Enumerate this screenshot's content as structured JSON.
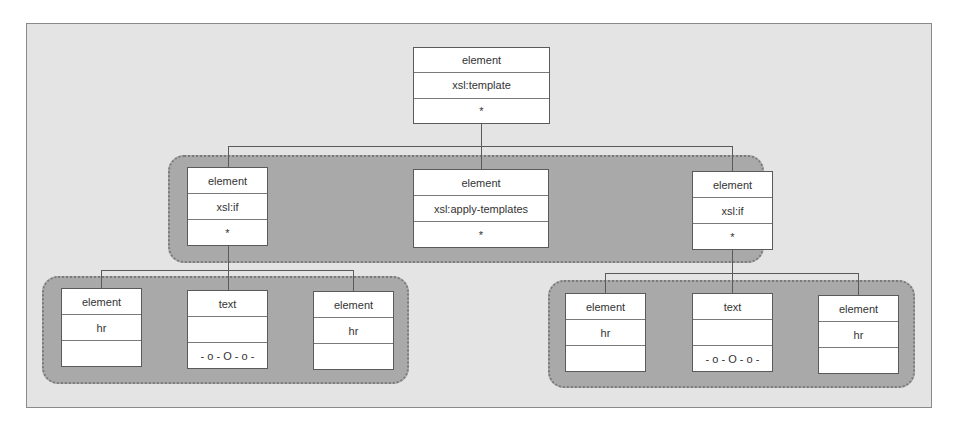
{
  "diagram": {
    "type": "tree",
    "root": {
      "id": "root",
      "kind": "element",
      "name": "xsl:template",
      "value": "*",
      "box": {
        "x": 413,
        "y": 47,
        "w": 137,
        "h": 77
      }
    },
    "level2": {
      "group_box": {
        "x": 168,
        "y": 155,
        "w": 596,
        "h": 108
      },
      "nodes": [
        {
          "id": "if-left",
          "kind": "element",
          "name": "xsl:if",
          "value": "*",
          "box": {
            "x": 187,
            "y": 167,
            "w": 81,
            "h": 79
          }
        },
        {
          "id": "apply",
          "kind": "element",
          "name": "xsl:apply-templates",
          "value": "*",
          "box": {
            "x": 413,
            "y": 169,
            "w": 136,
            "h": 79
          }
        },
        {
          "id": "if-right",
          "kind": "element",
          "name": "xsl:if",
          "value": "*",
          "box": {
            "x": 692,
            "y": 171,
            "w": 81,
            "h": 79
          }
        }
      ]
    },
    "level3_left": {
      "parent": "if-left",
      "group_box": {
        "x": 42,
        "y": 276,
        "w": 367,
        "h": 108
      },
      "nodes": [
        {
          "kind": "element",
          "name": "hr",
          "value": "",
          "box": {
            "x": 61,
            "y": 288,
            "w": 81,
            "h": 79
          }
        },
        {
          "kind": "text",
          "name": "",
          "value": "- o - O - o -",
          "box": {
            "x": 187,
            "y": 290,
            "w": 81,
            "h": 79
          }
        },
        {
          "kind": "element",
          "name": "hr",
          "value": "",
          "box": {
            "x": 313,
            "y": 291,
            "w": 81,
            "h": 79
          }
        }
      ]
    },
    "level3_right": {
      "parent": "if-right",
      "group_box": {
        "x": 548,
        "y": 280,
        "w": 367,
        "h": 108
      },
      "nodes": [
        {
          "kind": "element",
          "name": "hr",
          "value": "",
          "box": {
            "x": 565,
            "y": 293,
            "w": 81,
            "h": 79
          }
        },
        {
          "kind": "text",
          "name": "",
          "value": "- o - O - o -",
          "box": {
            "x": 692,
            "y": 293,
            "w": 81,
            "h": 79
          }
        },
        {
          "kind": "element",
          "name": "hr",
          "value": "",
          "box": {
            "x": 818,
            "y": 295,
            "w": 81,
            "h": 79
          }
        }
      ]
    }
  },
  "colors": {
    "frame_bg": "#e4e4e4",
    "group_bg": "#a9a9a9",
    "node_bg": "#ffffff",
    "line": "#5a5a5a"
  }
}
